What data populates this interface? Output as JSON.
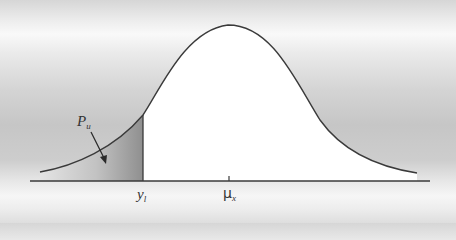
{
  "diagram": {
    "type": "normal-distribution-lower-tail",
    "labels": {
      "probability": {
        "main": "P",
        "sub": "u"
      },
      "lower_limit": {
        "main": "y",
        "sub": "l"
      },
      "mean": {
        "main": "μ",
        "sub": "x"
      }
    },
    "colors": {
      "curve": "#3a3a3a",
      "axis": "#3a3a3a",
      "under_curve_fill": "#ffffff",
      "tail_shade_dark": "#8e8e8e",
      "tail_shade_light": "#e6e6e6"
    }
  }
}
